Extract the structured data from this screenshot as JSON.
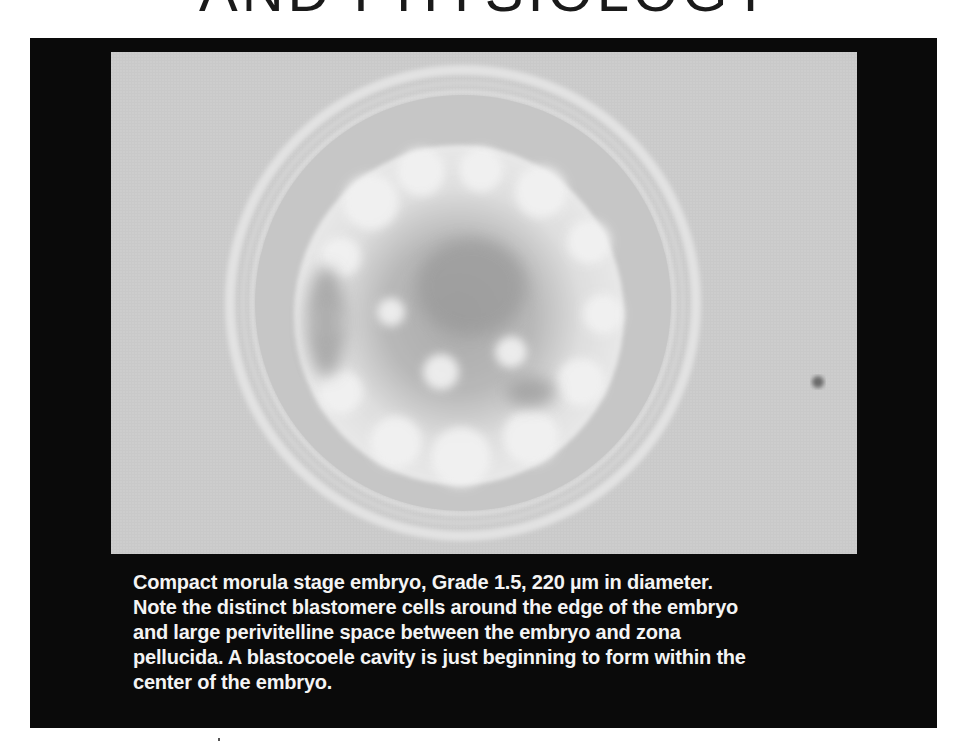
{
  "page": {
    "title": "AND PHYSIOLOGY"
  },
  "figure": {
    "image_description": "Microscope image of compact morula stage embryo within zona pellucida",
    "caption_lines": [
      "Compact morula stage embryo, Grade 1.5, 220 µm in diameter.",
      "Note the distinct blastomere cells around the edge of the embryo",
      "and large perivitelline space between the embryo and zona",
      "pellucida. A blastocoele cavity is just beginning to form within the",
      "center of the embryo."
    ]
  },
  "colors": {
    "frame_background": "#0a0a0a",
    "micrograph_background": "#c9c9c9",
    "caption_text": "#f4f4f4",
    "title_text": "#1a1a1a"
  }
}
